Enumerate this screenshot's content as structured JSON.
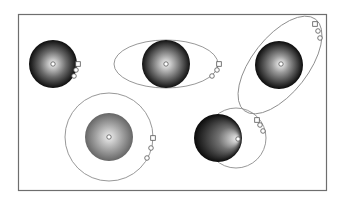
{
  "frame": {
    "x": 18,
    "y": 14,
    "w": 308,
    "h": 176,
    "stroke": "#6e6e6e"
  },
  "colors": {
    "light": "#f2f2f2",
    "dark": "#0e0e0e",
    "mid": "#8a8a8a",
    "path": "#8c8c8c",
    "handle_stroke": "#555555",
    "handle_fill": "#ffffff"
  },
  "spheres": [
    {
      "name": "sphere-1-circular-center",
      "cx": 53,
      "cy": 64,
      "r": 24,
      "focus": {
        "x": 53,
        "y": 64
      },
      "gradient_stops": [
        {
          "o": 0,
          "c": "#f4f4f4"
        },
        {
          "o": 0.55,
          "c": "#6a6a6a"
        },
        {
          "o": 1,
          "c": "#0d0d0d"
        }
      ],
      "ellipse": null,
      "handles": [
        {
          "t": "square",
          "x": 78,
          "y": 64
        },
        {
          "t": "circle",
          "x": 76,
          "y": 70
        },
        {
          "t": "circle",
          "x": 74,
          "y": 76
        }
      ]
    },
    {
      "name": "sphere-2-horizontal-ellipse",
      "cx": 166,
      "cy": 64,
      "r": 24,
      "focus": {
        "x": 166,
        "y": 64
      },
      "gradient_stops": [
        {
          "o": 0,
          "c": "#f6f6f6"
        },
        {
          "o": 0.6,
          "c": "#6c6c6c"
        },
        {
          "o": 1,
          "c": "#111111"
        }
      ],
      "ellipse": {
        "cx": 166,
        "cy": 64,
        "rx": 52,
        "ry": 24,
        "rot": 0
      },
      "handles": [
        {
          "t": "square",
          "x": 219,
          "y": 64
        },
        {
          "t": "circle",
          "x": 217,
          "y": 70
        },
        {
          "t": "circle",
          "x": 212,
          "y": 76
        }
      ]
    },
    {
      "name": "sphere-3-rotated-ellipse",
      "cx": 279,
      "cy": 65,
      "r": 24,
      "focus": {
        "x": 281,
        "y": 64
      },
      "gradient_stops": [
        {
          "o": 0,
          "c": "#f8f8f8"
        },
        {
          "o": 0.35,
          "c": "#9a9a9a"
        },
        {
          "o": 1,
          "c": "#0b0b0b"
        }
      ],
      "ellipse": {
        "cx": 280,
        "cy": 65,
        "rx": 58,
        "ry": 28,
        "rot": -52
      },
      "handles": [
        {
          "t": "square",
          "x": 315,
          "y": 24
        },
        {
          "t": "circle",
          "x": 318,
          "y": 31
        },
        {
          "t": "circle",
          "x": 320,
          "y": 38
        }
      ]
    },
    {
      "name": "sphere-4-large-circle-soft",
      "cx": 109,
      "cy": 137,
      "r": 24,
      "focus": {
        "x": 109,
        "y": 137
      },
      "gradient_stops": [
        {
          "o": 0,
          "c": "#eeeeee"
        },
        {
          "o": 0.55,
          "c": "#a2a2a2"
        },
        {
          "o": 1,
          "c": "#666666"
        }
      ],
      "ellipse": {
        "cx": 109,
        "cy": 137,
        "rx": 44,
        "ry": 44,
        "rot": 0
      },
      "handles": [
        {
          "t": "square",
          "x": 153,
          "y": 138
        },
        {
          "t": "circle",
          "x": 151,
          "y": 148
        },
        {
          "t": "circle",
          "x": 147,
          "y": 158
        }
      ]
    },
    {
      "name": "sphere-5-offset-focus",
      "cx": 218,
      "cy": 138,
      "r": 24,
      "focus": {
        "x": 238,
        "y": 139
      },
      "gradient_stops": [
        {
          "o": 0,
          "c": "#f4f4f4"
        },
        {
          "o": 0.45,
          "c": "#707070"
        },
        {
          "o": 1,
          "c": "#0a0a0a"
        }
      ],
      "ellipse": {
        "cx": 236,
        "cy": 138,
        "rx": 30,
        "ry": 30,
        "rot": 0
      },
      "handles": [
        {
          "t": "square",
          "x": 257,
          "y": 120
        },
        {
          "t": "circle",
          "x": 260,
          "y": 125
        },
        {
          "t": "circle",
          "x": 263,
          "y": 131
        }
      ]
    }
  ]
}
